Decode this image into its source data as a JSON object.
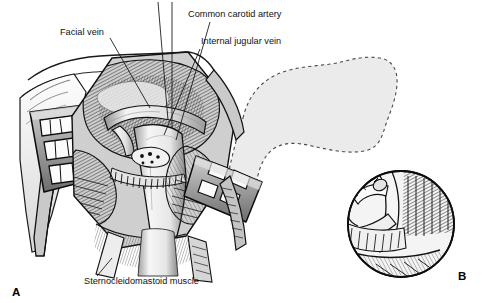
{
  "figure": {
    "background_color": "#ffffff",
    "ink_color": "#111111",
    "mandible_fill": "#ebebeb",
    "tissue_light": "#f2f2f2",
    "tissue_mid": "#b5b5b5",
    "tissue_dark": "#4a4a4a",
    "retractor_fill": "#9a9a9a"
  },
  "panels": [
    {
      "id": "A",
      "letter": "A",
      "name": "main-surgical-field",
      "description": "Open neck dissection with retractors exposing vessels"
    },
    {
      "id": "B",
      "letter": "B",
      "name": "inset-detail-circle",
      "description": "Circular magnified inset of vessel anastomosis"
    }
  ],
  "labels": [
    {
      "id": "facial-vein",
      "text": "Facial vein",
      "x": 60,
      "y": 35,
      "anchor": "start",
      "leader": [
        [
          110,
          38
        ],
        [
          150,
          108
        ]
      ]
    },
    {
      "id": "common-carotid-artery",
      "text": "Common carotid artery",
      "x": 188,
      "y": 17,
      "anchor": "start",
      "leader": [
        [
          210,
          22
        ],
        [
          176,
          140
        ]
      ]
    },
    {
      "id": "internal-jugular-vein",
      "text": "Internal jugular vein",
      "x": 201,
      "y": 44,
      "anchor": "start",
      "leader": [
        [
          200,
          49
        ],
        [
          164,
          135
        ]
      ]
    },
    {
      "id": "sternocleidomastoid-muscle",
      "text": "Sternocleidomastoid muscle",
      "x": 84,
      "y": 284,
      "anchor": "start",
      "leader": [
        [
          112,
          258
        ],
        [
          97,
          276
        ]
      ]
    }
  ],
  "panel_letters": [
    {
      "id": "letter-a",
      "text": "A",
      "x": 12,
      "y": 296
    },
    {
      "id": "letter-b",
      "text": "B",
      "x": 458,
      "y": 280
    }
  ],
  "inset": {
    "center_x": 401,
    "center_y": 224,
    "radius": 53
  }
}
